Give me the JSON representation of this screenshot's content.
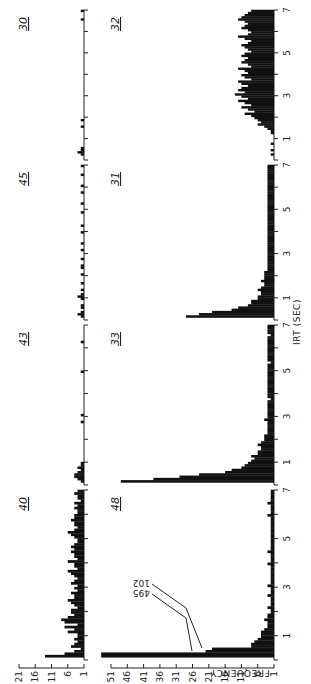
{
  "chart_data": {
    "type": "bar",
    "title": "",
    "orientation_note": "figure rotated 90 degrees counter-clockwise",
    "xlabel": "IRT (SEC)",
    "ylabel": "FREQUENCY",
    "x_ticks": [
      "1",
      "3",
      "5",
      "7"
    ],
    "xlim": [
      0,
      7
    ],
    "bin_width": 0.1,
    "rows": [
      {
        "row": "top",
        "y_ticks": [
          "1",
          "6",
          "11",
          "16",
          "21"
        ],
        "ylim": [
          1,
          21
        ],
        "panels": [
          {
            "label": "40",
            "values": [
              1,
              13,
              7,
              4,
              2,
              5,
              4,
              3,
              4,
              3,
              3,
              6,
              4,
              7,
              3,
              7,
              8,
              6,
              4,
              5,
              5,
              3,
              4,
              5,
              6,
              4,
              4,
              5,
              3,
              4,
              3,
              5,
              4,
              3,
              4,
              5,
              6,
              3,
              4,
              4,
              6,
              3,
              4,
              4,
              5,
              4,
              5,
              4,
              3,
              3,
              4,
              5,
              6,
              4,
              3,
              4,
              4,
              5,
              4,
              4,
              3,
              3,
              4,
              3,
              4,
              2,
              3,
              3,
              4,
              3
            ]
          },
          {
            "label": "43",
            "values": [
              1,
              2,
              3,
              4,
              4,
              3,
              2,
              3,
              2,
              2,
              1,
              1,
              1,
              1,
              1,
              1,
              1,
              1,
              1,
              1,
              1,
              1,
              1,
              1,
              1,
              1,
              1,
              2,
              1,
              1,
              2,
              1,
              1,
              1,
              1,
              1,
              1,
              1,
              1,
              1,
              1,
              1,
              1,
              1,
              1,
              1,
              1,
              1,
              1,
              2,
              1,
              1,
              1,
              1,
              1,
              1,
              1,
              1,
              1,
              1,
              1,
              1,
              2,
              1,
              1,
              1,
              1,
              1,
              1,
              1
            ]
          },
          {
            "label": "45",
            "values": [
              1,
              2,
              3,
              2,
              1,
              2,
              2,
              1,
              1,
              2,
              3,
              2,
              1,
              2,
              1,
              1,
              2,
              1,
              1,
              1,
              2,
              1,
              1,
              2,
              2,
              1,
              1,
              2,
              1,
              1,
              1,
              2,
              1,
              1,
              2,
              1,
              1,
              1,
              1,
              2,
              1,
              1,
              2,
              1,
              1,
              1,
              1,
              1,
              2,
              1,
              1,
              1,
              2,
              1,
              1,
              1,
              1,
              2,
              1,
              1,
              2,
              1,
              1,
              1,
              1,
              2,
              1,
              1,
              1,
              2
            ]
          },
          {
            "label": "30",
            "values": [
              1,
              1,
              2,
              3,
              2,
              2,
              1,
              1,
              1,
              1,
              1,
              1,
              1,
              1,
              1,
              2,
              1,
              1,
              2,
              1,
              1,
              1,
              1,
              1,
              1,
              1,
              1,
              1,
              1,
              1,
              1,
              1,
              1,
              1,
              1,
              1,
              1,
              1,
              1,
              1,
              1,
              1,
              1,
              1,
              1,
              1,
              1,
              1,
              1,
              1,
              1,
              1,
              1,
              1,
              1,
              1,
              1,
              1,
              1,
              1,
              1,
              1,
              1,
              1,
              1,
              2,
              1,
              1,
              1,
              2
            ]
          }
        ]
      },
      {
        "row": "bottom",
        "y_ticks": [
          "1",
          "6",
          "11",
          "16",
          "21",
          "26",
          "31",
          "36",
          "41",
          "46",
          "51"
        ],
        "ylim": [
          1,
          51
        ],
        "annotations": [
          "495",
          "102"
        ],
        "panels": [
          {
            "label": "48",
            "values": [
              1,
              495,
              102,
              22,
              20,
              8,
              8,
              7,
              6,
              5,
              5,
              5,
              4,
              3,
              3,
              3,
              4,
              3,
              3,
              2,
              2,
              3,
              2,
              2,
              2,
              2,
              3,
              2,
              2,
              2,
              3,
              2,
              2,
              2,
              2,
              2,
              2,
              2,
              2,
              3,
              2,
              2,
              2,
              2,
              3,
              2,
              2,
              2,
              2,
              2,
              2,
              2,
              2,
              2,
              2,
              2,
              2,
              2,
              2,
              3,
              2,
              2,
              2,
              2,
              3,
              2,
              2,
              2,
              2,
              2
            ]
          },
          {
            "label": "33",
            "values": [
              1,
              48,
              38,
              30,
              24,
              16,
              14,
              11,
              10,
              9,
              8,
              7,
              8,
              6,
              6,
              5,
              5,
              6,
              5,
              4,
              4,
              4,
              3,
              3,
              3,
              3,
              3,
              3,
              4,
              3,
              3,
              3,
              3,
              3,
              3,
              3,
              3,
              2,
              3,
              3,
              3,
              3,
              3,
              3,
              3,
              3,
              3,
              3,
              3,
              3,
              3,
              3,
              3,
              2,
              3,
              3,
              3,
              3,
              3,
              3,
              3,
              3,
              3,
              3,
              3,
              2,
              3,
              3,
              3,
              3
            ]
          },
          {
            "label": "31",
            "values": [
              1,
              28,
              24,
              20,
              14,
              12,
              9,
              8,
              8,
              6,
              6,
              5,
              5,
              6,
              5,
              4,
              4,
              5,
              4,
              4,
              4,
              4,
              3,
              3,
              3,
              3,
              3,
              3,
              3,
              3,
              3,
              3,
              3,
              3,
              3,
              3,
              3,
              3,
              3,
              3,
              3,
              3,
              3,
              3,
              3,
              3,
              3,
              3,
              3,
              3,
              3,
              3,
              3,
              3,
              3,
              3,
              3,
              3,
              3,
              3,
              3,
              3,
              3,
              3,
              3,
              3,
              3,
              3,
              3,
              3
            ]
          },
          {
            "label": "32",
            "values": [
              1,
              1,
              2,
              1,
              2,
              1,
              1,
              2,
              1,
              1,
              1,
              1,
              2,
              2,
              3,
              4,
              6,
              5,
              6,
              7,
              8,
              10,
              7,
              9,
              11,
              8,
              10,
              12,
              9,
              11,
              13,
              10,
              12,
              11,
              9,
              11,
              12,
              8,
              10,
              11,
              9,
              10,
              12,
              8,
              9,
              11,
              10,
              9,
              11,
              10,
              8,
              9,
              10,
              11,
              9,
              8,
              10,
              12,
              9,
              8,
              9,
              11,
              10,
              9,
              10,
              12,
              11,
              10,
              9,
              8
            ]
          }
        ]
      }
    ]
  },
  "figure": {
    "ylabel": "FREQUENCY",
    "xlabel": "IRT (SEC)",
    "annotation_high": "495",
    "annotation_low": "102",
    "x_tick_labels": [
      "1",
      "3",
      "5",
      "7"
    ],
    "top_panels": [
      "40",
      "43",
      "45",
      "30"
    ],
    "bottom_panels": [
      "48",
      "33",
      "31",
      "32"
    ],
    "top_y_ticks": [
      "21",
      "16",
      "11",
      "6",
      "1"
    ],
    "bottom_y_ticks": [
      "51",
      "46",
      "41",
      "36",
      "31",
      "26",
      "21",
      "16",
      "11",
      "6",
      "1"
    ]
  }
}
